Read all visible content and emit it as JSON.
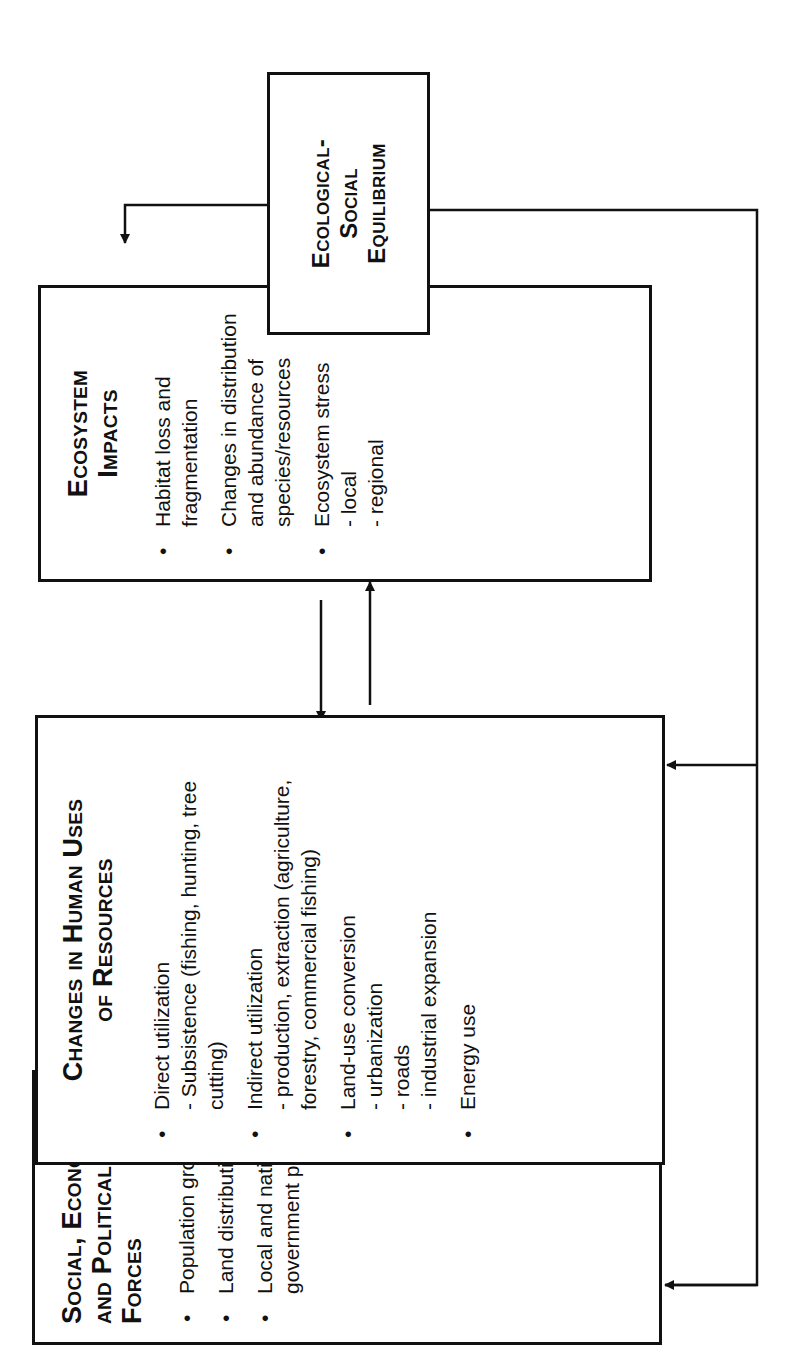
{
  "diagram": {
    "boxes": {
      "social": {
        "title": "Social, Economic, and Political Forces",
        "items": [
          {
            "text": "Population growth"
          },
          {
            "text": "Land distribution"
          },
          {
            "text": "Local and national government policies"
          }
        ]
      },
      "changes": {
        "title": "Changes in Human Uses of Resources",
        "items": [
          {
            "text": "Direct utilization",
            "subs": [
              "- Subsistence (fishing, hunting, tree cutting)"
            ]
          },
          {
            "text": "Indirect utilization",
            "subs": [
              "- production, extraction (agriculture, forestry, commercial fishing)"
            ]
          },
          {
            "text": "Land-use conversion",
            "subs": [
              "- urbanization",
              "- roads",
              "- industrial expansion"
            ]
          },
          {
            "text": "Energy use"
          }
        ]
      },
      "ecosystem": {
        "title": "Ecosystem Impacts",
        "items": [
          {
            "text": "Habitat loss and fragmentation"
          },
          {
            "text": "Changes in distribution and abundance of species/resources"
          },
          {
            "text": "Ecosystem stress",
            "subs": [
              "- local",
              "- regional"
            ]
          }
        ]
      },
      "equilibrium": {
        "title": "Ecological-Social Equilibrium"
      }
    },
    "arrows": [
      {
        "from": "social",
        "to": "changes"
      },
      {
        "from": "changes",
        "to": "social"
      },
      {
        "from": "changes",
        "to": "ecosystem"
      },
      {
        "from": "ecosystem",
        "to": "changes"
      },
      {
        "from": "ecosystem",
        "to": "equilibrium"
      },
      {
        "from": "equilibrium",
        "to": "feedback (left, open arrow)"
      },
      {
        "from": "equilibrium",
        "to": "changes"
      },
      {
        "from": "equilibrium",
        "to": "social"
      }
    ]
  }
}
